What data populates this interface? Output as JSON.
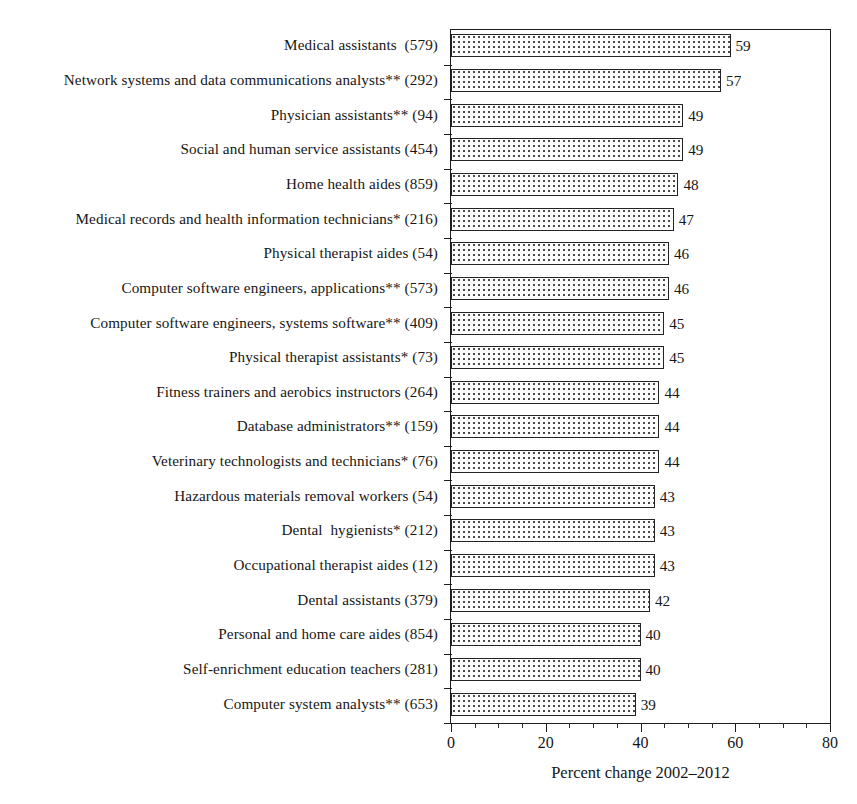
{
  "chart_data": {
    "type": "bar",
    "orientation": "horizontal",
    "title": "",
    "xlabel": "Percent change 2002–2012",
    "ylabel": "",
    "xlim": [
      0,
      80
    ],
    "xticks": [
      0,
      20,
      40,
      60,
      80
    ],
    "xtick_labels": [
      "0",
      "20",
      "40",
      "60",
      "80"
    ],
    "minor_tick_interval": 5,
    "grid": false,
    "legend": null,
    "bar_fill": "dotted-stipple",
    "bar_edge_color": "#232323",
    "categories": [
      "Medical assistants  (579)",
      "Network systems and data communications analysts** (292)",
      "Physician assistants** (94)",
      "Social and human service assistants (454)",
      "Home health aides (859)",
      "Medical records and health information technicians* (216)",
      "Physical therapist aides (54)",
      "Computer software engineers, applications** (573)",
      "Computer software engineers, systems software** (409)",
      "Physical therapist assistants* (73)",
      "Fitness trainers and aerobics instructors (264)",
      "Database administrators** (159)",
      "Veterinary technologists and technicians* (76)",
      "Hazardous materials removal workers (54)",
      "Dental  hygienists* (212)",
      "Occupational therapist aides (12)",
      "Dental assistants (379)",
      "Personal and home care aides (854)",
      "Self-enrichment education teachers (281)",
      "Computer system analysts** (653)"
    ],
    "values": [
      59,
      57,
      49,
      49,
      48,
      47,
      46,
      46,
      45,
      45,
      44,
      44,
      44,
      43,
      43,
      43,
      42,
      40,
      40,
      39
    ],
    "value_labels": [
      "59",
      "57",
      "49",
      "49",
      "48",
      "47",
      "46",
      "46",
      "45",
      "45",
      "44",
      "44",
      "44",
      "43",
      "43",
      "43",
      "42",
      "40",
      "40",
      "39"
    ]
  }
}
